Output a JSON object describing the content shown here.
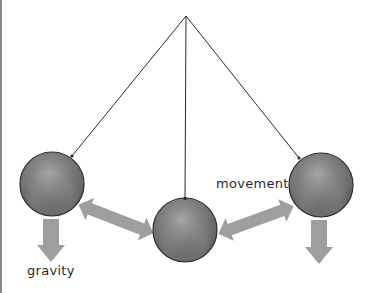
{
  "diagram": {
    "type": "pendulum",
    "labels": {
      "gravity": "gravity",
      "movement": "movement"
    },
    "colors": {
      "background": "#ffffff",
      "string": "#2b2b2b",
      "ball_base": "#6e6e6e",
      "ball_highlight": "#a8a8a8",
      "ball_outline": "#2e2e2e",
      "arrow": "#9e9e9e",
      "left_border": "#8a8a8a"
    },
    "pivot": {
      "x": 186,
      "y": 16
    },
    "balls": [
      {
        "id": "left",
        "cx": 52,
        "cy": 184,
        "r": 32
      },
      {
        "id": "center",
        "cx": 185,
        "cy": 230,
        "r": 32
      },
      {
        "id": "right",
        "cx": 321,
        "cy": 185,
        "r": 32
      }
    ],
    "arrows": [
      {
        "id": "gravity-left",
        "kind": "down"
      },
      {
        "id": "gravity-right",
        "kind": "down"
      },
      {
        "id": "movement-left",
        "kind": "double"
      },
      {
        "id": "movement-right",
        "kind": "double"
      }
    ]
  }
}
